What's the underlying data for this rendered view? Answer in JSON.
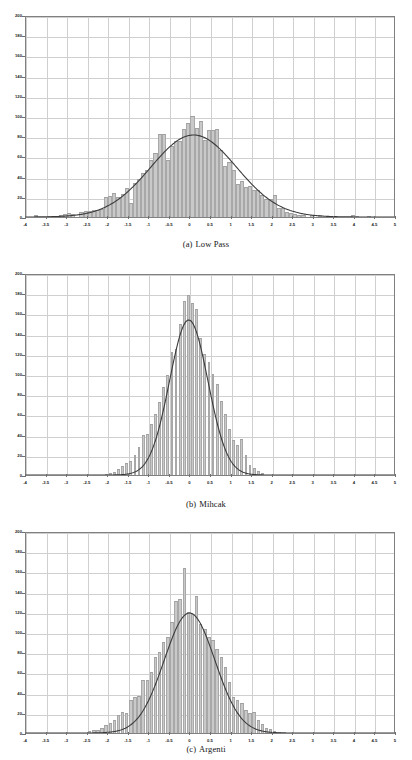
{
  "figure": {
    "background": "#ffffff",
    "bar_color": "#c9c9c9",
    "bar_edge_color": "#a8a8a8",
    "curve_color": "#3a3a3a",
    "grid_color": "#cfcfcf",
    "axis_color": "#808080"
  },
  "panels": [
    {
      "id": "panel-a",
      "caption_label": "(a)",
      "caption_text": "Low Pass"
    },
    {
      "id": "panel-b",
      "caption_label": "(b)",
      "caption_text": "Mihcak"
    },
    {
      "id": "panel-c",
      "caption_label": "(c)",
      "caption_text": "Argenti"
    }
  ],
  "chart_data": [
    {
      "type": "bar",
      "title": "(a)   Low Pass",
      "xlabel": "",
      "ylabel": "",
      "xlim": [
        -4,
        5
      ],
      "ylim": [
        0,
        200
      ],
      "grid": true,
      "legend": null,
      "xticks": [
        -4,
        -3.5,
        -3,
        -2.5,
        -2,
        -1.5,
        -1,
        -0.5,
        0,
        0.5,
        1,
        1.5,
        2,
        2.5,
        3,
        3.5,
        4,
        4.5,
        5
      ],
      "xtick_labels": [
        "-4",
        "-3.5",
        "-3",
        "-2.5",
        "-2",
        "-1.5",
        "-1",
        "-0.5",
        "0",
        "0.5",
        "1",
        "1.5",
        "2",
        "2.5",
        "3",
        "3.5",
        "4",
        "4.5",
        "5"
      ],
      "yticks": [
        0,
        20,
        40,
        60,
        80,
        100,
        120,
        140,
        160,
        180,
        200
      ],
      "ytick_labels": [
        "0",
        "20",
        "40",
        "60",
        "80",
        "100",
        "120",
        "140",
        "160",
        "180",
        "200"
      ],
      "bin_width": 0.1,
      "bin_centers": [
        -3.75,
        -3.45,
        -3.15,
        -3.05,
        -2.95,
        -2.85,
        -2.65,
        -2.55,
        -2.45,
        -2.35,
        -2.25,
        -2.15,
        -2.05,
        -1.95,
        -1.85,
        -1.75,
        -1.65,
        -1.55,
        -1.45,
        -1.35,
        -1.25,
        -1.15,
        -1.05,
        -0.95,
        -0.85,
        -0.75,
        -0.65,
        -0.55,
        -0.45,
        -0.35,
        -0.25,
        -0.15,
        -0.05,
        0.05,
        0.15,
        0.25,
        0.35,
        0.45,
        0.55,
        0.65,
        0.75,
        0.85,
        0.95,
        1.05,
        1.15,
        1.25,
        1.35,
        1.45,
        1.55,
        1.65,
        1.75,
        1.85,
        1.95,
        2.05,
        2.15,
        2.25,
        2.35,
        2.45,
        2.55,
        2.65,
        2.75,
        2.95,
        3.15,
        3.35,
        3.55,
        3.95,
        4.05,
        4.35
      ],
      "values": [
        2,
        1,
        2,
        3,
        4,
        3,
        5,
        6,
        6,
        7,
        7,
        8,
        20,
        21,
        24,
        20,
        23,
        29,
        14,
        34,
        38,
        44,
        47,
        56,
        63,
        82,
        82,
        56,
        70,
        75,
        75,
        87,
        93,
        100,
        88,
        95,
        76,
        86,
        86,
        87,
        66,
        51,
        54,
        47,
        33,
        36,
        30,
        31,
        27,
        27,
        22,
        18,
        18,
        22,
        9,
        9,
        5,
        4,
        3,
        2,
        2,
        2,
        2,
        1,
        1,
        2,
        1,
        1
      ],
      "fit_curve": {
        "label": "gaussian fit",
        "peak": 82,
        "mean": 0.1,
        "sigma": 1.05
      }
    },
    {
      "type": "bar",
      "title": "(b) Mihcak",
      "xlabel": "",
      "ylabel": "",
      "xlim": [
        -4,
        5
      ],
      "ylim": [
        0,
        200
      ],
      "grid": true,
      "legend": null,
      "xticks": [
        -4,
        -3.5,
        -3,
        -2.5,
        -2,
        -1.5,
        -1,
        -0.5,
        0,
        0.5,
        1,
        1.5,
        2,
        2.5,
        3,
        3.5,
        4,
        4.5,
        5
      ],
      "xtick_labels": [
        "-4",
        "-3.5",
        "-3",
        "-2.5",
        "-2",
        "-1.5",
        "-1",
        "-0.5",
        "0",
        "0.5",
        "1",
        "1.5",
        "2",
        "2.5",
        "3",
        "3.5",
        "4",
        "4.5",
        "5"
      ],
      "yticks": [
        0,
        20,
        40,
        60,
        80,
        100,
        120,
        140,
        160,
        180,
        200
      ],
      "ytick_labels": [
        "0",
        "20",
        "40",
        "60",
        "80",
        "100",
        "120",
        "140",
        "160",
        "180",
        "200"
      ],
      "bin_width": 0.07,
      "bin_centers": [
        -2.05,
        -1.95,
        -1.85,
        -1.75,
        -1.65,
        -1.55,
        -1.45,
        -1.35,
        -1.25,
        -1.15,
        -1.05,
        -0.95,
        -0.85,
        -0.75,
        -0.65,
        -0.55,
        -0.45,
        -0.35,
        -0.25,
        -0.15,
        -0.05,
        0.05,
        0.15,
        0.25,
        0.35,
        0.45,
        0.55,
        0.65,
        0.75,
        0.85,
        0.95,
        1.05,
        1.15,
        1.25,
        1.35,
        1.45,
        1.55,
        1.65,
        1.75
      ],
      "values": [
        1,
        2,
        3,
        6,
        9,
        12,
        14,
        20,
        28,
        40,
        41,
        51,
        60,
        72,
        87,
        99,
        122,
        125,
        150,
        172,
        178,
        170,
        164,
        136,
        120,
        112,
        100,
        90,
        73,
        60,
        46,
        35,
        30,
        36,
        20,
        10,
        7,
        4,
        2
      ],
      "fit_curve": {
        "label": "gaussian fit",
        "peak": 155,
        "mean": -0.02,
        "sigma": 0.47
      }
    },
    {
      "type": "bar",
      "title": "(c) Argenti",
      "xlabel": "",
      "ylabel": "",
      "xlim": [
        -4,
        5
      ],
      "ylim": [
        0,
        200
      ],
      "grid": true,
      "legend": null,
      "xticks": [
        -4,
        -3.5,
        -3,
        -2.5,
        -2,
        -1.5,
        -1,
        -0.5,
        0,
        0.5,
        1,
        1.5,
        2,
        2.5,
        3,
        3.5,
        4,
        4.5,
        5
      ],
      "xtick_labels": [
        "-4",
        "-3.5",
        "-3",
        "-2.5",
        "-2",
        "-1.5",
        "-1",
        "-0.5",
        "0",
        "0.5",
        "1",
        "1.5",
        "2",
        "2.5",
        "3",
        "3.5",
        "4",
        "4.5",
        "5"
      ],
      "yticks": [
        0,
        20,
        40,
        60,
        80,
        100,
        120,
        140,
        160,
        180,
        200
      ],
      "ytick_labels": [
        "0",
        "20",
        "40",
        "60",
        "80",
        "100",
        "120",
        "140",
        "160",
        "180",
        "200"
      ],
      "bin_width": 0.085,
      "bin_centers": [
        -2.45,
        -2.35,
        -2.25,
        -2.15,
        -2.05,
        -1.95,
        -1.85,
        -1.75,
        -1.65,
        -1.55,
        -1.45,
        -1.35,
        -1.25,
        -1.15,
        -1.05,
        -0.95,
        -0.85,
        -0.75,
        -0.65,
        -0.55,
        -0.45,
        -0.35,
        -0.25,
        -0.15,
        -0.05,
        0.05,
        0.15,
        0.25,
        0.35,
        0.45,
        0.55,
        0.65,
        0.75,
        0.85,
        0.95,
        1.05,
        1.15,
        1.25,
        1.35,
        1.45,
        1.55,
        1.65,
        1.75,
        1.85,
        1.95,
        2.05,
        2.15
      ],
      "values": [
        2,
        3,
        3,
        5,
        8,
        10,
        13,
        18,
        21,
        20,
        33,
        36,
        37,
        52,
        52,
        60,
        75,
        80,
        90,
        95,
        110,
        131,
        133,
        163,
        120,
        118,
        136,
        108,
        103,
        95,
        92,
        83,
        75,
        65,
        51,
        36,
        33,
        30,
        23,
        20,
        21,
        13,
        9,
        5,
        4,
        2,
        1
      ],
      "fit_curve": {
        "label": "gaussian fit",
        "peak": 120,
        "mean": 0.0,
        "sigma": 0.62
      }
    }
  ]
}
